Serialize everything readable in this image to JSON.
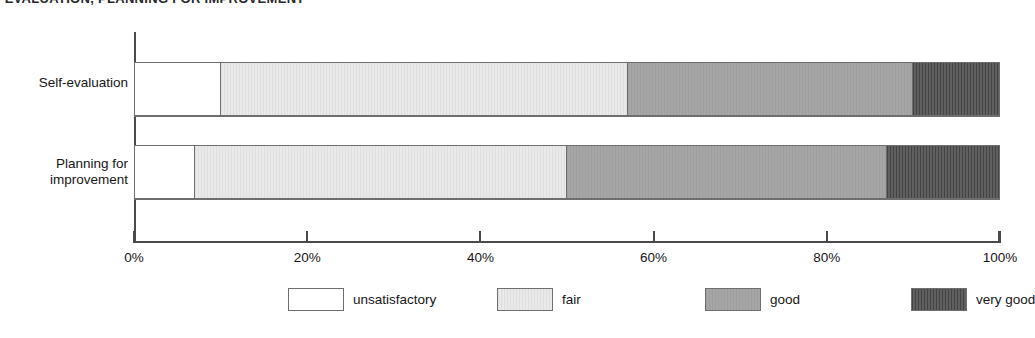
{
  "title": "-EVALUATION, PLANNING FOR IMPROVEMENT",
  "axis": {
    "ticks": [
      {
        "label": "0%",
        "value": 0
      },
      {
        "label": "20%",
        "value": 20
      },
      {
        "label": "40%",
        "value": 40
      },
      {
        "label": "60%",
        "value": 60
      },
      {
        "label": "80%",
        "value": 80
      },
      {
        "label": "100%",
        "value": 100
      }
    ]
  },
  "categories": [
    {
      "line1": "Self-evaluation",
      "line2": ""
    },
    {
      "line1": "Planning for",
      "line2": "improvement"
    }
  ],
  "legend": [
    {
      "label": "unsatisfactory",
      "color": "#ffffff"
    },
    {
      "label": "fair",
      "color": "#e9e9e9"
    },
    {
      "label": "good",
      "color": "#a6a6a6"
    },
    {
      "label": "very good",
      "color": "#575757"
    }
  ],
  "chart_data": {
    "type": "bar",
    "orientation": "horizontal",
    "stacked": true,
    "stack_total": 100,
    "title": "-EVALUATION, PLANNING FOR IMPROVEMENT",
    "xlabel": "",
    "ylabel": "",
    "xlim": [
      0,
      100
    ],
    "xticks": [
      0,
      20,
      40,
      60,
      80,
      100
    ],
    "xtick_labels": [
      "0%",
      "20%",
      "40%",
      "60%",
      "80%",
      "100%"
    ],
    "grid": false,
    "legend_position": "bottom",
    "categories": [
      "Self-evaluation",
      "Planning for improvement"
    ],
    "series": [
      {
        "name": "unsatisfactory",
        "color": "#ffffff",
        "values": [
          10,
          7
        ]
      },
      {
        "name": "fair",
        "color": "#e9e9e9",
        "values": [
          47,
          43
        ]
      },
      {
        "name": "good",
        "color": "#a6a6a6",
        "values": [
          33,
          37
        ]
      },
      {
        "name": "very good",
        "color": "#575757",
        "values": [
          10,
          13
        ]
      }
    ]
  }
}
